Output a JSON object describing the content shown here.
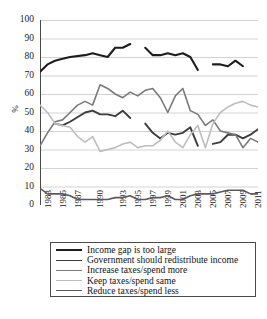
{
  "chart_data": {
    "type": "line",
    "title": "",
    "xlabel": "",
    "ylabel": "%",
    "ylim": [
      0,
      100
    ],
    "ytick_values": [
      0,
      10,
      20,
      30,
      40,
      50,
      60,
      70,
      80,
      90,
      100
    ],
    "xlim": [
      1983,
      2012
    ],
    "grid": true,
    "legend_position": "below",
    "xtick_labels": [
      "1983",
      "1985",
      "1987",
      "1990",
      "1993",
      "1995",
      "1997",
      "1999",
      "2001",
      "2003",
      "2005",
      "2007",
      "2009",
      "2011"
    ],
    "xtick_years": [
      1983,
      1985,
      1987,
      1990,
      1993,
      1995,
      1997,
      1999,
      2001,
      2003,
      2005,
      2007,
      2009,
      2011
    ],
    "x_all_years": [
      1983,
      1984,
      1985,
      1986,
      1987,
      1988,
      1989,
      1990,
      1991,
      1992,
      1993,
      1994,
      1995,
      1996,
      1997,
      1998,
      1999,
      2000,
      2001,
      2002,
      2003,
      2004,
      2005,
      2006,
      2007,
      2008,
      2009,
      2010,
      2011,
      2012
    ],
    "series": [
      {
        "name": "Income gap is too large",
        "color": "#1d1d1d",
        "width": 2.1,
        "points": [
          [
            1983,
            72
          ],
          [
            1984,
            76
          ],
          [
            1985,
            78
          ],
          [
            1986,
            79
          ],
          [
            1987,
            80
          ],
          [
            1989,
            81
          ],
          [
            1990,
            82
          ],
          [
            1991,
            81
          ],
          [
            1992,
            80
          ],
          [
            1993,
            85
          ],
          [
            1994,
            85
          ],
          [
            1995,
            87
          ],
          [
            1996,
            null
          ],
          [
            1997,
            85
          ],
          [
            1998,
            81
          ],
          [
            1999,
            81
          ],
          [
            2000,
            82
          ],
          [
            2001,
            81
          ],
          [
            2002,
            82
          ],
          [
            2003,
            80
          ],
          [
            2004,
            73
          ],
          [
            2005,
            null
          ],
          [
            2006,
            76
          ],
          [
            2007,
            76
          ],
          [
            2008,
            75
          ],
          [
            2009,
            78
          ],
          [
            2010,
            75
          ]
        ]
      },
      {
        "name": "Government should redistribute income",
        "color": "#3c3c3c",
        "width": 1.9,
        "points": [
          [
            1985,
            44
          ],
          [
            1986,
            43
          ],
          [
            1987,
            45
          ],
          [
            1989,
            50
          ],
          [
            1990,
            51
          ],
          [
            1991,
            49
          ],
          [
            1992,
            49
          ],
          [
            1993,
            48
          ],
          [
            1994,
            51
          ],
          [
            1995,
            47
          ],
          [
            1996,
            null
          ],
          [
            1997,
            44
          ],
          [
            1998,
            39
          ],
          [
            1999,
            36
          ],
          [
            2000,
            39
          ],
          [
            2001,
            38
          ],
          [
            2002,
            39
          ],
          [
            2003,
            42
          ],
          [
            2004,
            32
          ],
          [
            2005,
            null
          ],
          [
            2006,
            33
          ],
          [
            2007,
            34
          ],
          [
            2008,
            38
          ],
          [
            2009,
            38
          ],
          [
            2010,
            36
          ],
          [
            2011,
            38
          ],
          [
            2012,
            41
          ]
        ]
      },
      {
        "name": "Increase taxes/spend more",
        "color": "#7a7a7a",
        "width": 1.6,
        "points": [
          [
            1983,
            32
          ],
          [
            1984,
            39
          ],
          [
            1985,
            45
          ],
          [
            1986,
            46
          ],
          [
            1987,
            50
          ],
          [
            1988,
            54
          ],
          [
            1989,
            56
          ],
          [
            1990,
            54
          ],
          [
            1991,
            65
          ],
          [
            1992,
            63
          ],
          [
            1993,
            60
          ],
          [
            1994,
            58
          ],
          [
            1995,
            61
          ],
          [
            1996,
            59
          ],
          [
            1997,
            62
          ],
          [
            1998,
            63
          ],
          [
            1999,
            58
          ],
          [
            2000,
            50
          ],
          [
            2001,
            59
          ],
          [
            2002,
            63
          ],
          [
            2003,
            51
          ],
          [
            2004,
            49
          ],
          [
            2005,
            43
          ],
          [
            2006,
            46
          ],
          [
            2007,
            40
          ],
          [
            2008,
            39
          ],
          [
            2009,
            38
          ],
          [
            2010,
            31
          ],
          [
            2011,
            36
          ],
          [
            2012,
            34
          ]
        ]
      },
      {
        "name": "Keep taxes/spend same",
        "color": "#bdbdbd",
        "width": 1.6,
        "points": [
          [
            1983,
            54
          ],
          [
            1984,
            50
          ],
          [
            1985,
            44
          ],
          [
            1986,
            43
          ],
          [
            1987,
            42
          ],
          [
            1988,
            37
          ],
          [
            1989,
            34
          ],
          [
            1990,
            37
          ],
          [
            1991,
            29
          ],
          [
            1992,
            30
          ],
          [
            1993,
            31
          ],
          [
            1994,
            33
          ],
          [
            1995,
            34
          ],
          [
            1996,
            31
          ],
          [
            1997,
            32
          ],
          [
            1998,
            32
          ],
          [
            1999,
            35
          ],
          [
            2000,
            40
          ],
          [
            2001,
            34
          ],
          [
            2002,
            31
          ],
          [
            2003,
            38
          ],
          [
            2004,
            43
          ],
          [
            2005,
            31
          ],
          [
            2006,
            44
          ],
          [
            2007,
            50
          ],
          [
            2008,
            53
          ],
          [
            2009,
            55
          ],
          [
            2010,
            56
          ],
          [
            2011,
            54
          ],
          [
            2012,
            53
          ]
        ]
      },
      {
        "name": "Reduce taxes/spend less",
        "color": "#5a5a5a",
        "width": 1.6,
        "points": [
          [
            1983,
            9
          ],
          [
            1984,
            6
          ],
          [
            1985,
            6
          ],
          [
            1986,
            6
          ],
          [
            1987,
            5
          ],
          [
            1988,
            3
          ],
          [
            1989,
            3
          ],
          [
            1990,
            3
          ],
          [
            1991,
            3
          ],
          [
            1992,
            3
          ],
          [
            1993,
            4
          ],
          [
            1994,
            4
          ],
          [
            1995,
            5
          ],
          [
            1996,
            3
          ],
          [
            1997,
            3
          ],
          [
            1998,
            4
          ],
          [
            1999,
            4
          ],
          [
            2000,
            5
          ],
          [
            2001,
            3
          ],
          [
            2002,
            3
          ],
          [
            2003,
            5
          ],
          [
            2004,
            6
          ],
          [
            2005,
            6
          ],
          [
            2006,
            6
          ],
          [
            2007,
            7
          ],
          [
            2008,
            8
          ],
          [
            2009,
            8
          ],
          [
            2010,
            8
          ],
          [
            2011,
            6
          ],
          [
            2012,
            6
          ]
        ]
      }
    ]
  },
  "axis": {
    "y_title": "%"
  }
}
